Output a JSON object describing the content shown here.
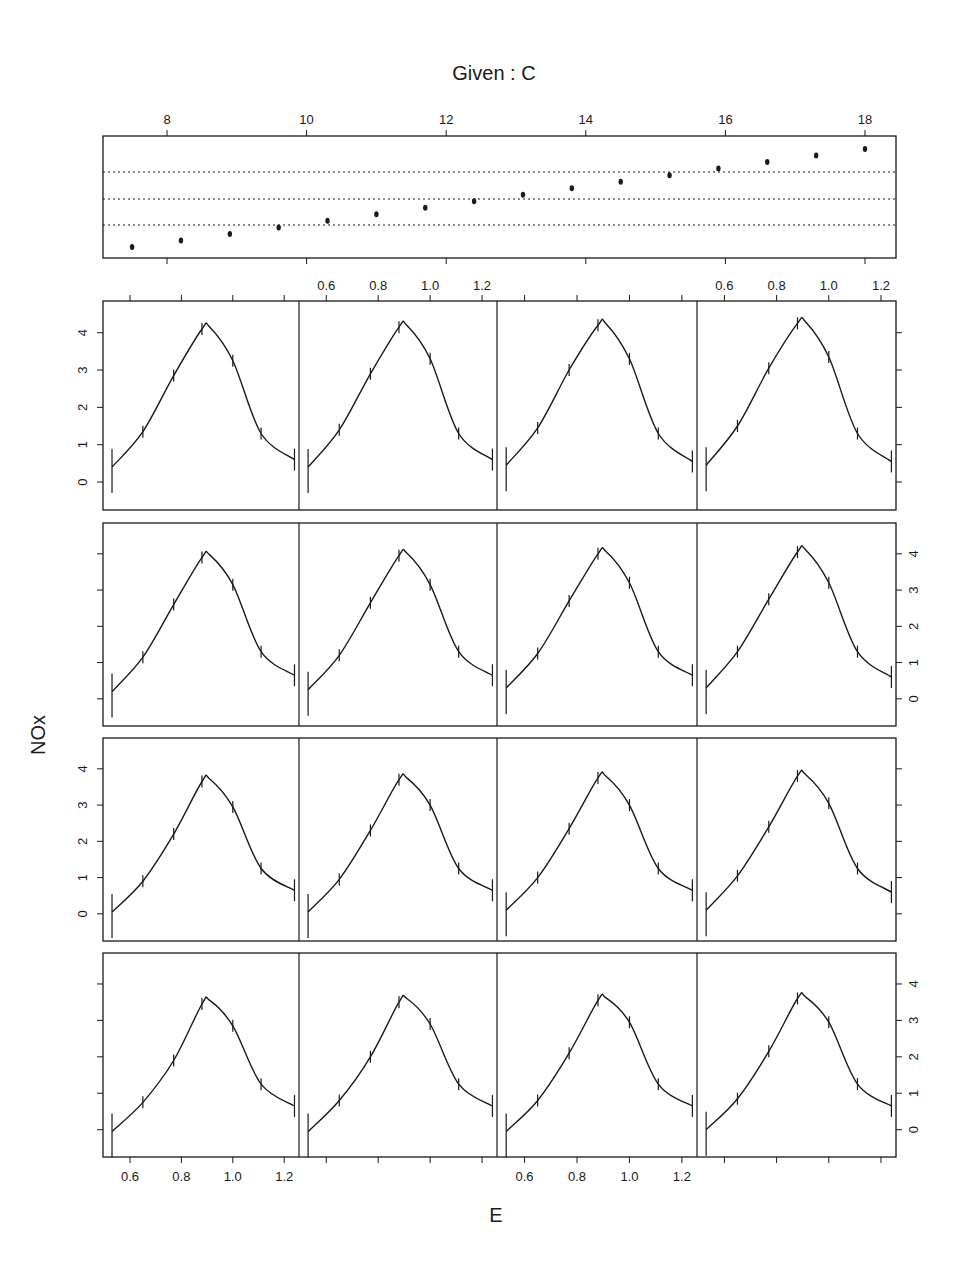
{
  "chart_data": {
    "type": "line",
    "kind": "coplot",
    "title": "Given : C",
    "xlabel": "E",
    "ylabel": "NOx",
    "given_panel": {
      "variable": "C",
      "axis_ticks": [
        8,
        10,
        12,
        14,
        16,
        18
      ],
      "xlim": [
        7.1,
        18.4
      ],
      "dotted_levels": 3,
      "points": [
        7.5,
        8.2,
        8.9,
        9.6,
        10.3,
        11.0,
        11.7,
        12.4,
        13.1,
        13.8,
        14.5,
        15.2,
        15.9,
        16.6,
        17.3,
        18.0
      ]
    },
    "x_ticks": [
      0.6,
      0.8,
      1.0,
      1.2
    ],
    "xlim": [
      0.5,
      1.27
    ],
    "y_ticks": [
      0,
      1,
      2,
      3,
      4
    ],
    "ylim": [
      -0.75,
      4.85
    ],
    "layout": {
      "rows": 4,
      "cols": 4,
      "order": "bottom-left to top-right"
    },
    "x": [
      0.53,
      0.65,
      0.77,
      0.88,
      1.0,
      1.11,
      1.24
    ],
    "series": [
      {
        "name": "panel 1 (row 4, col 1)",
        "row": 4,
        "col": 1,
        "values": [
          -0.05,
          0.75,
          1.9,
          3.45,
          2.85,
          1.25,
          0.65
        ],
        "peak": 3.55
      },
      {
        "name": "panel 2 (row 4, col 2)",
        "row": 4,
        "col": 2,
        "values": [
          -0.05,
          0.8,
          2.0,
          3.5,
          2.9,
          1.25,
          0.65
        ],
        "peak": 3.6
      },
      {
        "name": "panel 3 (row 4, col 3)",
        "row": 4,
        "col": 3,
        "values": [
          -0.05,
          0.8,
          2.1,
          3.55,
          2.95,
          1.25,
          0.65
        ],
        "peak": 3.62
      },
      {
        "name": "panel 4 (row 4, col 4)",
        "row": 4,
        "col": 4,
        "values": [
          0.0,
          0.85,
          2.15,
          3.6,
          2.95,
          1.25,
          0.65
        ],
        "peak": 3.65
      },
      {
        "name": "panel 5 (row 3, col 1)",
        "row": 3,
        "col": 1,
        "values": [
          0.05,
          0.9,
          2.2,
          3.65,
          2.95,
          1.25,
          0.65
        ],
        "peak": 3.72
      },
      {
        "name": "panel 6 (row 3, col 2)",
        "row": 3,
        "col": 2,
        "values": [
          0.05,
          0.95,
          2.3,
          3.7,
          3.0,
          1.25,
          0.65
        ],
        "peak": 3.75
      },
      {
        "name": "panel 7 (row 3, col 3)",
        "row": 3,
        "col": 3,
        "values": [
          0.1,
          1.0,
          2.35,
          3.75,
          3.0,
          1.25,
          0.65
        ],
        "peak": 3.8
      },
      {
        "name": "panel 8 (row 3, col 4)",
        "row": 3,
        "col": 4,
        "values": [
          0.1,
          1.05,
          2.4,
          3.8,
          3.05,
          1.25,
          0.6
        ],
        "peak": 3.85
      },
      {
        "name": "panel 9 (row 2, col 1)",
        "row": 2,
        "col": 1,
        "values": [
          0.2,
          1.15,
          2.6,
          3.9,
          3.15,
          1.3,
          0.65
        ],
        "peak": 3.97
      },
      {
        "name": "panel 10 (row 2, col 2)",
        "row": 2,
        "col": 2,
        "values": [
          0.25,
          1.2,
          2.65,
          3.95,
          3.15,
          1.3,
          0.65
        ],
        "peak": 4.02
      },
      {
        "name": "panel 11 (row 2, col 3)",
        "row": 2,
        "col": 3,
        "values": [
          0.3,
          1.25,
          2.7,
          4.0,
          3.2,
          1.3,
          0.65
        ],
        "peak": 4.07
      },
      {
        "name": "panel 12 (row 2, col 4)",
        "row": 2,
        "col": 4,
        "values": [
          0.3,
          1.3,
          2.75,
          4.05,
          3.2,
          1.3,
          0.6
        ],
        "peak": 4.12
      },
      {
        "name": "panel 13 (row 1, col 1)",
        "row": 1,
        "col": 1,
        "values": [
          0.4,
          1.35,
          2.85,
          4.1,
          3.25,
          1.3,
          0.6
        ],
        "peak": 4.15
      },
      {
        "name": "panel 14 (row 1, col 2)",
        "row": 1,
        "col": 2,
        "values": [
          0.4,
          1.4,
          2.9,
          4.15,
          3.3,
          1.3,
          0.6
        ],
        "peak": 4.2
      },
      {
        "name": "panel 15 (row 1, col 3)",
        "row": 1,
        "col": 3,
        "values": [
          0.45,
          1.45,
          3.0,
          4.2,
          3.3,
          1.3,
          0.55
        ],
        "peak": 4.25
      },
      {
        "name": "panel 16 (row 1, col 4)",
        "row": 1,
        "col": 4,
        "values": [
          0.45,
          1.5,
          3.05,
          4.25,
          3.35,
          1.3,
          0.55
        ],
        "peak": 4.3
      }
    ],
    "grid": false,
    "legend": null
  },
  "labels": {
    "title": "Given :  C",
    "xlabel": "E",
    "ylabel": "NOx"
  },
  "colors": {
    "ink": "#1a1a1a",
    "background": "#ffffff"
  }
}
